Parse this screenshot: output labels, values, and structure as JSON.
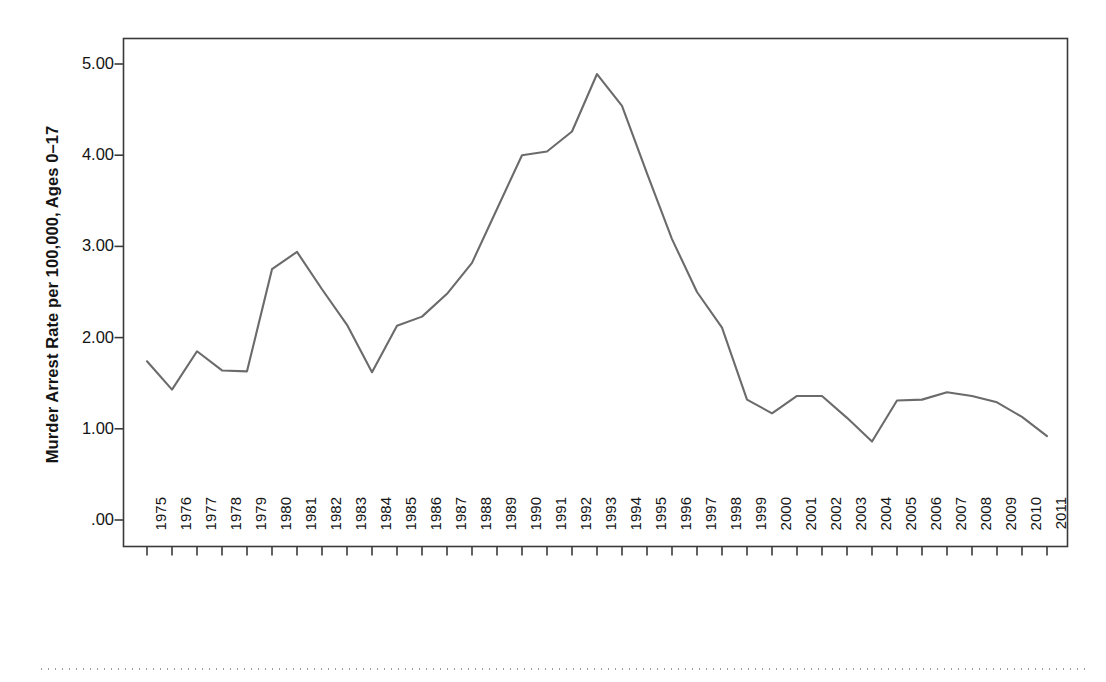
{
  "figure": {
    "background_color": "#ffffff",
    "frame_color": "#3a3a3a",
    "line_color": "#6b6b6b",
    "text_color": "#141414"
  },
  "axes": {
    "y_title": "Murder Arrest Rate per 100,000, Ages 0–17",
    "x_title": "Year",
    "y_tick_labels": [
      "5.00",
      "4.00",
      "3.00",
      "2.00",
      "1.00",
      ".00"
    ],
    "y_tick_values": [
      5.0,
      4.0,
      3.0,
      2.0,
      1.0,
      0.0
    ]
  },
  "scan_artifact": {
    "dotted_rule": "dotted-scan-line"
  },
  "chart_data": {
    "type": "line",
    "title": "",
    "xlabel": "Year",
    "ylabel": "Murder Arrest Rate per 100,000, Ages 0–17",
    "xlim": [
      1974.3,
      2011.9
    ],
    "ylim": [
      0.0,
      5.29
    ],
    "grid": false,
    "legend": "none",
    "line_color": "#6b6b6b",
    "line_width": 2.1,
    "markers": "none",
    "categories": [
      "1975",
      "1976",
      "1977",
      "1978",
      "1979",
      "1980",
      "1981",
      "1982",
      "1983",
      "1984",
      "1985",
      "1986",
      "1987",
      "1988",
      "1989",
      "1990",
      "1991",
      "1992",
      "1993",
      "1994",
      "1995",
      "1996",
      "1997",
      "1998",
      "1999",
      "2000",
      "2001",
      "2002",
      "2003",
      "2004",
      "2005",
      "2006",
      "2007",
      "2008",
      "2009",
      "2010",
      "2011"
    ],
    "x": [
      1975,
      1976,
      1977,
      1978,
      1979,
      1980,
      1981,
      1982,
      1983,
      1984,
      1985,
      1986,
      1987,
      1988,
      1989,
      1990,
      1991,
      1992,
      1993,
      1994,
      1995,
      1996,
      1997,
      1998,
      1999,
      2000,
      2001,
      2002,
      2003,
      2004,
      2005,
      2006,
      2007,
      2008,
      2009,
      2010,
      2011
    ],
    "values": [
      1.74,
      1.43,
      1.85,
      1.64,
      1.63,
      2.75,
      2.94,
      2.53,
      2.14,
      1.62,
      2.13,
      2.23,
      2.48,
      2.82,
      3.41,
      4.0,
      4.04,
      4.26,
      4.89,
      4.54,
      3.8,
      3.08,
      2.5,
      2.11,
      1.32,
      1.17,
      1.36,
      1.36,
      1.12,
      0.86,
      1.31,
      1.32,
      1.4,
      1.36,
      1.29,
      1.13,
      0.92
    ],
    "series": [
      {
        "name": "Murder Arrest Rate, Ages 0-17",
        "values": [
          1.74,
          1.43,
          1.85,
          1.64,
          1.63,
          2.75,
          2.94,
          2.53,
          2.14,
          1.62,
          2.13,
          2.23,
          2.48,
          2.82,
          3.41,
          4.0,
          4.04,
          4.26,
          4.89,
          4.54,
          3.8,
          3.08,
          2.5,
          2.11,
          1.32,
          1.17,
          1.36,
          1.36,
          1.12,
          0.86,
          1.31,
          1.32,
          1.4,
          1.36,
          1.29,
          1.13,
          0.92
        ]
      }
    ],
    "annotations": {
      "peak_year": "1993",
      "peak_value": 4.89,
      "min_year": "2004",
      "min_value": 0.86
    }
  }
}
